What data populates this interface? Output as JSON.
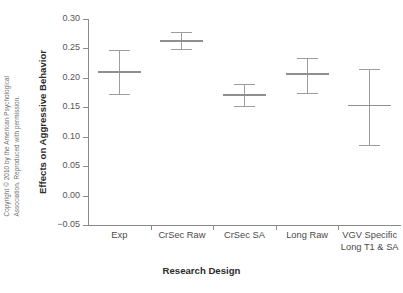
{
  "chart_data": {
    "type": "scatter",
    "title": "",
    "xlabel": "Research Design",
    "ylabel": "Effects on Aggressive Behavior",
    "ylim": [
      -0.05,
      0.3
    ],
    "ytick_labels": [
      "0.30",
      "0.25",
      "0.20",
      "0.15",
      "0.10",
      "0.05",
      "0.00",
      "−0.05"
    ],
    "ytick_values": [
      0.3,
      0.25,
      0.2,
      0.15,
      0.1,
      0.05,
      0.0,
      -0.05
    ],
    "grid": false,
    "legend": "none",
    "categories": [
      "Exp",
      "CrSec Raw",
      "CrSec SA",
      "Long Raw",
      "VGV Specific\nLong T1 & SA"
    ],
    "series": [
      {
        "name": "Effect size with 95% confidence interval",
        "values": [
          0.21,
          0.262,
          0.171,
          0.206,
          0.153
        ],
        "ci_low": [
          0.172,
          0.248,
          0.152,
          0.174,
          0.086
        ],
        "ci_high": [
          0.247,
          0.277,
          0.189,
          0.233,
          0.214
        ]
      }
    ]
  },
  "axes": {
    "y_title": "Effects on Aggressive Behavior",
    "x_title": "Research Design"
  },
  "notes": {
    "copyright": "Copyright © 2010 by the American Psychological\nAssociation. Reproduced with permission."
  }
}
